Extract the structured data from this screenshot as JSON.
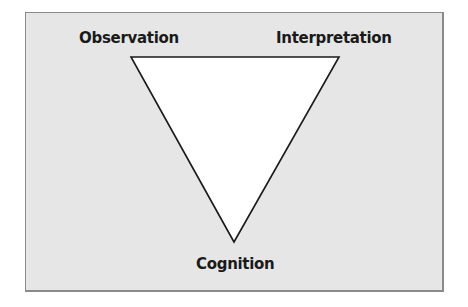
{
  "diagram": {
    "type": "inverted-triangle",
    "vertices": {
      "top_left": "Observation",
      "top_right": "Interpretation",
      "bottom": "Cognition"
    },
    "colors": {
      "background": "#e6e6e6",
      "triangle_fill": "#ffffff",
      "stroke": "#1a1a1a",
      "frame_border": "#8a8a8a"
    }
  }
}
